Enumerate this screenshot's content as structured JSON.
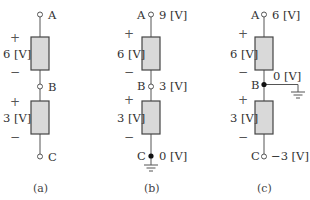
{
  "circuits": [
    {
      "caption": "(a)",
      "nodes": {
        "A": {
          "name": "A",
          "voltage": ""
        },
        "B": {
          "name": "B",
          "voltage": ""
        },
        "C": {
          "name": "C",
          "voltage": ""
        }
      },
      "elements": [
        {
          "label": "6 [V]",
          "plus": "+",
          "minus": "−"
        },
        {
          "label": "3 [V]",
          "plus": "+",
          "minus": "−"
        }
      ],
      "ground": "none"
    },
    {
      "caption": "(b)",
      "nodes": {
        "A": {
          "name": "A",
          "voltage": "9 [V]"
        },
        "B": {
          "name": "B",
          "voltage": "3 [V]"
        },
        "C": {
          "name": "C",
          "voltage": "0 [V]"
        }
      },
      "elements": [
        {
          "label": "6 [V]",
          "plus": "+",
          "minus": "−"
        },
        {
          "label": "3 [V]",
          "plus": "+",
          "minus": "−"
        }
      ],
      "ground": "C"
    },
    {
      "caption": "(c)",
      "nodes": {
        "A": {
          "name": "A",
          "voltage": "6 [V]"
        },
        "B": {
          "name": "B",
          "voltage": "0 [V]"
        },
        "C": {
          "name": "C",
          "voltage": "−3 [V]"
        }
      },
      "elements": [
        {
          "label": "6 [V]",
          "plus": "+",
          "minus": "−"
        },
        {
          "label": "3 [V]",
          "plus": "+",
          "minus": "−"
        }
      ],
      "ground": "B"
    }
  ],
  "colors": {
    "element_fill": "#d9d9d9",
    "wire": "#555555",
    "text": "#333333"
  }
}
